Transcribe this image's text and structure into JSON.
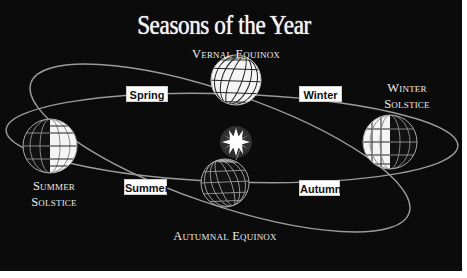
{
  "title": "Seasons of the Year",
  "positions": {
    "vernal_equinox": "Vernal Equinox",
    "summer_solstice": [
      "Summer",
      "Solstice"
    ],
    "winter_solstice": [
      "Winter",
      "Solstice"
    ],
    "autumnal_equinox": "Autumnal Equinox"
  },
  "seasons": {
    "spring": "Spring",
    "winter": "Winter",
    "summer": "Summer",
    "autumn": "Autumn"
  },
  "icons": {
    "sun": "sun-icon",
    "globe": "earth-globe-icon"
  },
  "colors": {
    "background": "#0b0b0b",
    "orbit": "#9a9a9a",
    "text": "#ececec",
    "label_box": "#ffffff"
  }
}
